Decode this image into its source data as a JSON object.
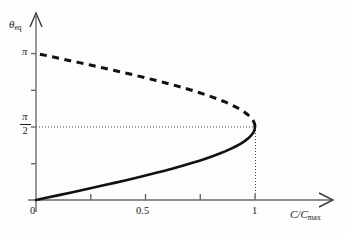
{
  "figure": {
    "kind": "bifurcation-diagram",
    "background_color": "#fdfdfd",
    "axis_color": "#555555",
    "curve_color": "#111111"
  },
  "axes": {
    "y": {
      "label": "θ",
      "label_sub": "eq",
      "ticks": [
        {
          "value": 0.7853981634,
          "label": "",
          "display": "π/4"
        },
        {
          "value": 1.5707963268,
          "label": "π/2",
          "display": "π/2"
        },
        {
          "value": 2.3561944902,
          "label": "",
          "display": "3π/4"
        },
        {
          "value": 3.1415926536,
          "label": "π",
          "display": "π"
        }
      ],
      "tick_pi": "π",
      "tick_halfpi_num": "π",
      "tick_halfpi_den": "2",
      "range": [
        0,
        3.4
      ]
    },
    "x": {
      "label": "C",
      "label_den": "C",
      "label_den_sub": "max",
      "label_full": "C/Cmax",
      "ticks": [
        {
          "value": 0,
          "label": "0"
        },
        {
          "value": 0.25,
          "label": ""
        },
        {
          "value": 0.5,
          "label": "0.5"
        },
        {
          "value": 0.75,
          "label": ""
        },
        {
          "value": 1.0,
          "label": "1"
        }
      ],
      "tick_0": "0",
      "tick_05": "0.5",
      "tick_1": "1",
      "range": [
        0,
        1.22
      ]
    }
  },
  "chart_data": {
    "type": "line",
    "title": "",
    "xlabel": "C/C_max",
    "ylabel": "theta_eq",
    "xlim": [
      0,
      1.22
    ],
    "ylim": [
      0,
      3.4
    ],
    "grid": false,
    "legend": "none",
    "annotations": [
      {
        "name": "fold-point",
        "x": 1.0,
        "y": 1.5707963268,
        "note": "saddle-node / turning point at C/Cmax = 1, theta_eq = pi/2"
      },
      {
        "name": "horizontal-guide",
        "type": "dotted-line",
        "y": 1.5707963268,
        "x_from": 0,
        "x_to": 1.0
      },
      {
        "name": "vertical-guide",
        "type": "dotted-line",
        "x": 1.0,
        "y_from": 0,
        "y_to": 1.5707963268
      }
    ],
    "series": [
      {
        "name": "stable-branch",
        "style": "solid",
        "color": "#111111",
        "width": 2.6,
        "x": [
          0.0,
          0.0523,
          0.1045,
          0.1564,
          0.2079,
          0.2588,
          0.309,
          0.3584,
          0.4067,
          0.454,
          0.5,
          0.5446,
          0.5878,
          0.6293,
          0.6691,
          0.7071,
          0.7431,
          0.7771,
          0.809,
          0.8387,
          0.866,
          0.891,
          0.9135,
          0.9336,
          0.9511,
          0.9659,
          0.9781,
          0.9877,
          0.9945,
          0.9986,
          1.0
        ],
        "y": [
          0.0,
          0.05236,
          0.10472,
          0.15708,
          0.20944,
          0.2618,
          0.31416,
          0.36652,
          0.41888,
          0.47124,
          0.5236,
          0.57596,
          0.62832,
          0.68068,
          0.73304,
          0.7854,
          0.83776,
          0.89012,
          0.94248,
          0.99484,
          1.0472,
          1.09956,
          1.15192,
          1.20428,
          1.25664,
          1.309,
          1.36136,
          1.41372,
          1.46608,
          1.51844,
          1.5708
        ]
      },
      {
        "name": "unstable-branch",
        "style": "dashed",
        "color": "#111111",
        "width": 3.0,
        "x": [
          1.0,
          0.9986,
          0.9945,
          0.9877,
          0.9781,
          0.9659,
          0.9511,
          0.9336,
          0.9135,
          0.891,
          0.866,
          0.8387,
          0.809,
          0.7771,
          0.7431,
          0.7071,
          0.6691,
          0.6293,
          0.5878,
          0.5446,
          0.5,
          0.454,
          0.4067,
          0.3584,
          0.309,
          0.2588,
          0.2079,
          0.1564,
          0.1045,
          0.0523,
          0.0
        ],
        "y": [
          1.5708,
          1.62316,
          1.67552,
          1.72788,
          1.78024,
          1.8326,
          1.88496,
          1.93732,
          1.98968,
          2.04204,
          2.0944,
          2.14676,
          2.19912,
          2.25148,
          2.30384,
          2.3562,
          2.40856,
          2.46092,
          2.51328,
          2.56564,
          2.618,
          2.67036,
          2.72272,
          2.77508,
          2.82744,
          2.8798,
          2.93216,
          2.98452,
          3.03688,
          3.08924,
          3.14159
        ]
      }
    ]
  }
}
